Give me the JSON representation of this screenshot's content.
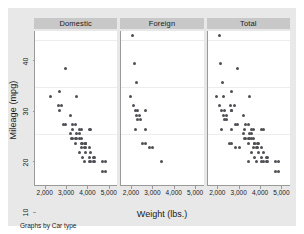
{
  "chart_data": {
    "type": "scatter",
    "title": "",
    "xlabel": "Weight (lbs.)",
    "ylabel": "Mileage (mpg)",
    "note": "Graphs by Car type",
    "xlim": [
      1500,
      5400
    ],
    "ylim": [
      9,
      42
    ],
    "xticks": [
      2000,
      3000,
      4000,
      5000
    ],
    "xticklabels": [
      "2,000",
      "3,000",
      "4,000",
      "5,000"
    ],
    "yticks": [
      10,
      20,
      30,
      40
    ],
    "yticklabels": [
      "10",
      "20",
      "30",
      "40"
    ],
    "gridlines_y": [
      20,
      30,
      40
    ],
    "grid": true,
    "legend": "none",
    "legend_position": "none",
    "marker_color": "#4f4f55",
    "panel_header_color": "#c8c8c8",
    "graph_region_color": "#e8e8e8",
    "plot_region_color": "#ffffff",
    "panels": [
      {
        "label": "Domestic",
        "points": [
          [
            2930,
            34
          ],
          [
            2640,
            29
          ],
          [
            2230,
            28
          ],
          [
            3470,
            28
          ],
          [
            2750,
            26
          ],
          [
            2600,
            26
          ],
          [
            2640,
            25
          ],
          [
            3180,
            24
          ],
          [
            3280,
            22
          ],
          [
            3430,
            22
          ],
          [
            2930,
            22
          ],
          [
            3690,
            21
          ],
          [
            4060,
            21
          ],
          [
            4130,
            21
          ],
          [
            3260,
            21
          ],
          [
            3200,
            20
          ],
          [
            3600,
            20
          ],
          [
            3420,
            19
          ],
          [
            3470,
            19
          ],
          [
            3600,
            19
          ],
          [
            3690,
            19
          ],
          [
            3740,
            18
          ],
          [
            3880,
            18
          ],
          [
            3720,
            18
          ],
          [
            3420,
            18
          ],
          [
            3900,
            18
          ],
          [
            3830,
            17
          ],
          [
            4060,
            17
          ],
          [
            3880,
            17
          ],
          [
            3900,
            16
          ],
          [
            4130,
            16
          ],
          [
            3600,
            16
          ],
          [
            4290,
            15
          ],
          [
            4330,
            15
          ],
          [
            4060,
            15
          ],
          [
            3740,
            15
          ],
          [
            4840,
            14
          ],
          [
            4720,
            14
          ],
          [
            4330,
            14
          ],
          [
            4130,
            14
          ],
          [
            3830,
            14
          ],
          [
            4060,
            14
          ],
          [
            4290,
            14
          ],
          [
            4840,
            12
          ],
          [
            4720,
            12
          ],
          [
            3600,
            21
          ],
          [
            3470,
            20
          ],
          [
            3280,
            19
          ],
          [
            3900,
            18
          ],
          [
            3690,
            17
          ],
          [
            2830,
            22
          ],
          [
            3250,
            19
          ]
        ]
      },
      {
        "label": "Foreign",
        "points": [
          [
            2050,
            41
          ],
          [
            2120,
            35
          ],
          [
            2200,
            31
          ],
          [
            1930,
            28
          ],
          [
            2070,
            26
          ],
          [
            2280,
            25
          ],
          [
            2650,
            25
          ],
          [
            2160,
            25
          ],
          [
            2240,
            24
          ],
          [
            2370,
            24
          ],
          [
            2410,
            23
          ],
          [
            2280,
            23
          ],
          [
            2160,
            21
          ],
          [
            2650,
            21
          ],
          [
            2520,
            18
          ],
          [
            2650,
            18
          ],
          [
            2830,
            17
          ],
          [
            2990,
            17
          ],
          [
            3420,
            14
          ]
        ]
      },
      {
        "label": "Total",
        "points": [
          [
            2050,
            41
          ],
          [
            2930,
            34
          ],
          [
            2120,
            35
          ],
          [
            2200,
            31
          ],
          [
            2640,
            29
          ],
          [
            2230,
            28
          ],
          [
            3470,
            28
          ],
          [
            1930,
            28
          ],
          [
            2750,
            26
          ],
          [
            2600,
            26
          ],
          [
            2070,
            26
          ],
          [
            2640,
            25
          ],
          [
            2280,
            25
          ],
          [
            2650,
            25
          ],
          [
            2160,
            25
          ],
          [
            3180,
            24
          ],
          [
            2240,
            24
          ],
          [
            2370,
            24
          ],
          [
            2410,
            23
          ],
          [
            2280,
            23
          ],
          [
            3280,
            22
          ],
          [
            3430,
            22
          ],
          [
            2930,
            22
          ],
          [
            2830,
            22
          ],
          [
            3690,
            21
          ],
          [
            4060,
            21
          ],
          [
            4130,
            21
          ],
          [
            3260,
            21
          ],
          [
            2160,
            21
          ],
          [
            2650,
            21
          ],
          [
            3600,
            21
          ],
          [
            3200,
            20
          ],
          [
            3600,
            20
          ],
          [
            3470,
            20
          ],
          [
            3420,
            19
          ],
          [
            3470,
            19
          ],
          [
            3600,
            19
          ],
          [
            3690,
            19
          ],
          [
            3250,
            19
          ],
          [
            3280,
            19
          ],
          [
            3740,
            18
          ],
          [
            3880,
            18
          ],
          [
            3720,
            18
          ],
          [
            3420,
            18
          ],
          [
            3900,
            18
          ],
          [
            2520,
            18
          ],
          [
            2650,
            18
          ],
          [
            3830,
            17
          ],
          [
            4060,
            17
          ],
          [
            3880,
            17
          ],
          [
            2830,
            17
          ],
          [
            2990,
            17
          ],
          [
            3690,
            17
          ],
          [
            3900,
            16
          ],
          [
            4130,
            16
          ],
          [
            3600,
            16
          ],
          [
            4290,
            15
          ],
          [
            4330,
            15
          ],
          [
            4060,
            15
          ],
          [
            3740,
            15
          ],
          [
            4840,
            14
          ],
          [
            4720,
            14
          ],
          [
            4330,
            14
          ],
          [
            4130,
            14
          ],
          [
            3830,
            14
          ],
          [
            4060,
            14
          ],
          [
            4290,
            14
          ],
          [
            3420,
            14
          ],
          [
            4840,
            12
          ],
          [
            4720,
            12
          ]
        ]
      }
    ]
  }
}
